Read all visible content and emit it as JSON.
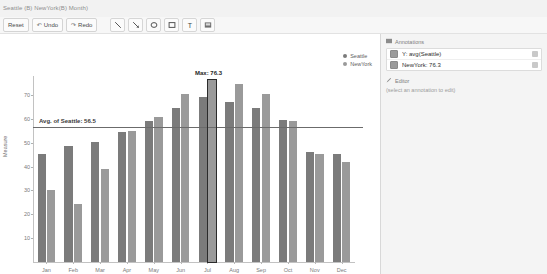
{
  "window": {
    "title": "Seattle (B) NewYork(B) Month)"
  },
  "toolbar": {
    "reset_label": "Reset",
    "undo_label": "Undo",
    "redo_label": "Redo",
    "undo_glyph": "↶",
    "redo_glyph": "↷",
    "tools": [
      {
        "name": "line-tool",
        "title": "Line"
      },
      {
        "name": "arrow-tool",
        "title": "Arrow"
      },
      {
        "name": "ellipse-tool",
        "title": "Ellipse"
      },
      {
        "name": "rectangle-tool",
        "title": "Rectangle"
      },
      {
        "name": "text-tool",
        "title": "Text",
        "glyph": "T"
      },
      {
        "name": "image-tool",
        "title": "Image"
      }
    ]
  },
  "legend": {
    "position": "top-right",
    "items": [
      {
        "label": "Seattle",
        "color": "#7b7b7b"
      },
      {
        "label": "NewYork",
        "color": "#9a9a9a"
      }
    ]
  },
  "annotations_panel": {
    "header": "Annotations",
    "items": [
      {
        "label": "Y: avg(Seattle)",
        "checked": true
      },
      {
        "label": "NewYork: 76.3",
        "checked": true
      }
    ],
    "editor_header": "Editor",
    "editor_hint": "(select an annotation to edit)",
    "delete_glyph": "×"
  },
  "chart_data": {
    "type": "bar",
    "title": "",
    "xlabel": "",
    "ylabel": "Measure",
    "ylim": [
      0,
      78
    ],
    "yticks": [
      10,
      20,
      30,
      40,
      50,
      60,
      70
    ],
    "grid": false,
    "categories": [
      "Jan",
      "Feb",
      "Mar",
      "Apr",
      "May",
      "Jun",
      "Jul",
      "Aug",
      "Sep",
      "Oct",
      "Nov",
      "Dec"
    ],
    "series": [
      {
        "name": "Seattle",
        "color": "#7b7b7b",
        "values": [
          45.5,
          48.5,
          50.5,
          54.5,
          59.0,
          64.5,
          69.0,
          67.0,
          64.5,
          59.5,
          46.0,
          45.5
        ]
      },
      {
        "name": "NewYork",
        "color": "#9a9a9a",
        "values": [
          30.0,
          24.5,
          39.0,
          55.0,
          61.0,
          70.5,
          76.3,
          74.5,
          70.5,
          59.0,
          45.5,
          42.0
        ]
      }
    ],
    "annotations": [
      {
        "kind": "hline",
        "label": "Avg. of Seattle: 56.5",
        "value": 56.5,
        "color": "#6b6b6b"
      },
      {
        "kind": "point",
        "label": "Max: 76.3",
        "value": 76.3,
        "category": "Jul",
        "series": "NewYork",
        "color": "#2b2b2b"
      }
    ]
  }
}
